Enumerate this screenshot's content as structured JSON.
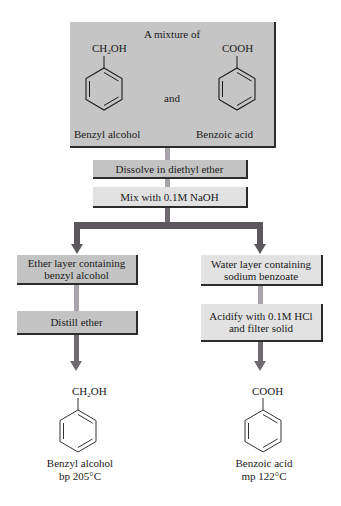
{
  "start": {
    "header": "A mixture of",
    "compound_left": {
      "group_main": "CH",
      "group_sub": "2",
      "group_tail": "OH",
      "name": "Benzyl alcohol"
    },
    "connector": "and",
    "compound_right": {
      "group": "COOH",
      "name": "Benzoic acid"
    }
  },
  "steps": {
    "dissolve": "Dissolve in diethyl ether",
    "mix": "Mix with 0.1M NaOH"
  },
  "left_branch": {
    "layer_line1": "Ether layer containing",
    "layer_line2": "benzyl alcohol",
    "step": "Distill ether",
    "product": {
      "group_main": "CH",
      "group_sub": "2",
      "group_tail": "OH",
      "name": "Benzyl alcohol",
      "property": "bp 205°C"
    }
  },
  "right_branch": {
    "layer_line1": "Water layer containing",
    "layer_line2": "sodium benzoate",
    "step_line1": "Acidify with 0.1M HCl",
    "step_line2": "and filter solid",
    "product": {
      "group": "COOH",
      "name": "Benzoic acid",
      "property": "mp 122°C"
    }
  },
  "colors": {
    "box_dark": "#c3c3c3",
    "box_light": "#e2e2e2",
    "connector": "#a9a4ab",
    "branch_bar": "#5b575d",
    "arrow": "#6e6a70"
  }
}
